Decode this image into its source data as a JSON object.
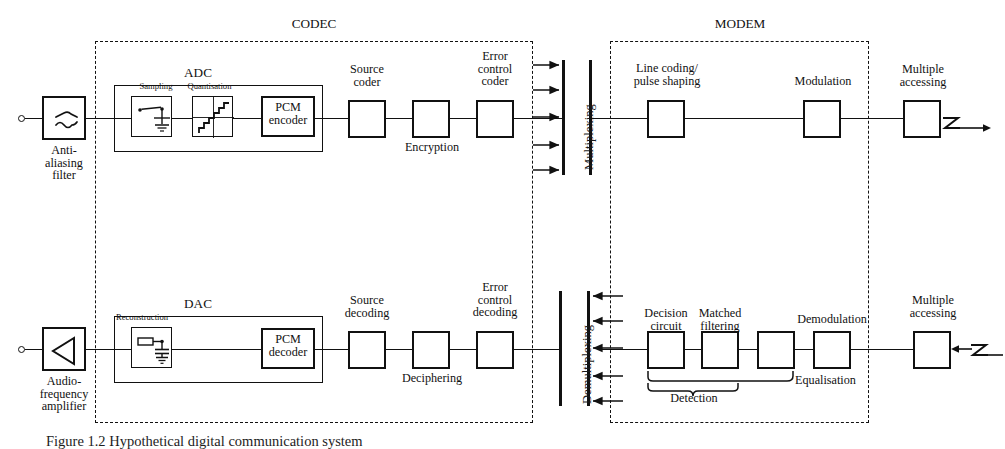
{
  "figure": {
    "caption": "Figure 1.2  Hypothetical digital communication system",
    "sections": {
      "codec": "CODEC",
      "modem": "MODEM"
    }
  },
  "transmit_chain": {
    "anti_aliasing_filter": "Anti-\naliasing\nfilter",
    "adc_group": "ADC",
    "sampling": "Sampling",
    "quantisation": "Quantisation",
    "pcm_encoder": "PCM\nencoder",
    "source_coder": "Source\ncoder",
    "encryption": "Encryption",
    "error_control_coder": "Error\ncontrol\ncoder",
    "multiplexing": "Multiplexing",
    "line_coding": "Line coding/\npulse shaping",
    "modulation": "Modulation",
    "multiple_accessing": "Multiple\naccessing"
  },
  "receive_chain": {
    "audio_amplifier": "Audio-\nfrequency\namplifier",
    "dac_group": "DAC",
    "reconstruction": "Reconstruction",
    "pcm_decoder": "PCM\ndecoder",
    "source_decoding": "Source\ndecoding",
    "deciphering": "Deciphering",
    "error_control_decoding": "Error\ncontrol\ndecoding",
    "demultiplexing": "Demultiplexing",
    "decision_circuit": "Decision\ncircuit",
    "matched_filtering": "Matched\nfiltering",
    "equalisation": "Equalisation",
    "detection": "Detection",
    "demodulation": "Demodulation",
    "multiple_accessing": "Multiple\naccessing"
  },
  "colors": {
    "ink": "#111111",
    "paper": "#ffffff"
  },
  "counts": {
    "mux_arrows": 5,
    "demux_arrows": 5
  }
}
